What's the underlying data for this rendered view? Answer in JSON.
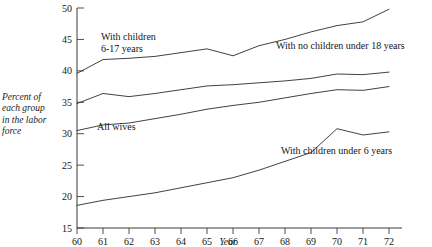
{
  "chart_data": {
    "type": "line",
    "title": "",
    "xlabel": "Year",
    "ylabel": "Percent of each group in the labor force",
    "ylabel_lines": [
      "Percent of",
      "each group",
      "in the labor",
      "force"
    ],
    "x": [
      1960,
      1961,
      1962,
      1963,
      1964,
      1965,
      1966,
      1967,
      1968,
      1969,
      1970,
      1971,
      1972
    ],
    "xtick_labels": [
      "60",
      "61",
      "62",
      "63",
      "64",
      "65",
      "66",
      "67",
      "68",
      "69",
      "70",
      "71",
      "72"
    ],
    "ytick_labels": [
      "15",
      "20",
      "25",
      "30",
      "35",
      "40",
      "45",
      "50"
    ],
    "yticks": [
      15,
      20,
      25,
      30,
      35,
      40,
      45,
      50
    ],
    "ylim": [
      15,
      50
    ],
    "xlim": [
      1960,
      1972
    ],
    "grid": false,
    "legend_position": "inline-annotations",
    "series": [
      {
        "name": "With children 6-17 years",
        "label_lines": [
          "With children",
          "6-17 years"
        ],
        "values": [
          39.6,
          41.8,
          42.0,
          42.3,
          42.9,
          43.5,
          42.4,
          44.0,
          45.0,
          46.2,
          47.2,
          47.8,
          49.8
        ]
      },
      {
        "name": "With no children under 18 years",
        "label_lines": [
          "With no children under 18 years"
        ],
        "values": [
          34.8,
          36.4,
          35.9,
          36.4,
          37.0,
          37.6,
          37.8,
          38.1,
          38.4,
          38.8,
          39.5,
          39.4,
          39.8
        ]
      },
      {
        "name": "All wives",
        "label_lines": [
          "All wives"
        ],
        "values": [
          30.5,
          31.4,
          31.7,
          32.4,
          33.1,
          33.9,
          34.5,
          35.0,
          35.7,
          36.4,
          37.0,
          36.9,
          37.5
        ]
      },
      {
        "name": "With children under 6 years",
        "label_lines": [
          "With children under 6 years"
        ],
        "values": [
          18.6,
          19.4,
          20.0,
          20.6,
          21.4,
          22.2,
          23.0,
          24.2,
          25.6,
          27.0,
          30.8,
          29.8,
          30.3
        ]
      }
    ],
    "annotations": [
      {
        "id": "annot-children-6-17",
        "text_lines": [
          "With children",
          "6-17 years"
        ],
        "x": 101,
        "y": 40
      },
      {
        "id": "annot-no-children-18",
        "text": "With no children under 18 years",
        "x": 276,
        "y": 49
      },
      {
        "id": "annot-all-wives",
        "text": "All wives",
        "x": 97,
        "y": 130
      },
      {
        "id": "annot-children-under-6",
        "text": "With children under 6 years",
        "x": 281,
        "y": 154
      }
    ]
  },
  "axis": {
    "x_title": "Year"
  }
}
